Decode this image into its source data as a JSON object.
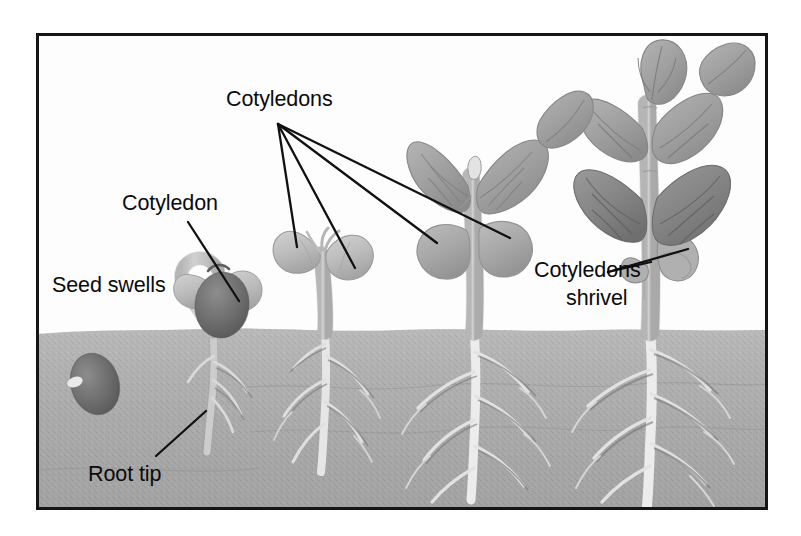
{
  "figure": {
    "frame": {
      "x": 36,
      "y": 33,
      "width": 732,
      "height": 477,
      "border_color": "#151515",
      "border_width": 3,
      "sky_color": "#fefefe"
    },
    "soil": {
      "label": "soil",
      "top_y": 330,
      "fill_light": "#b9b9b9",
      "fill_dark": "#8e8e8e",
      "texture": "speckled-grey"
    },
    "colors": {
      "ink": "#0b0b0b",
      "leader_line": "#111111",
      "cotyledon_pale": "#c3c3c3",
      "cotyledon_mid": "#a8a8a8",
      "seed_dark": "#6f6f6f",
      "stem_pale": "#d8d8d8",
      "leaf_mid": "#a4a4a4",
      "leaf_dark": "#8a8a8a",
      "root_pale": "#e8e8e8",
      "root_shadow": "#6a6a6a"
    }
  },
  "labels": [
    {
      "id": "cotyledons-top",
      "text": "Cotyledons",
      "x": 226,
      "y": 106,
      "anchor": "start",
      "leader_origin": {
        "x": 278,
        "y": 124
      },
      "leader_targets": [
        {
          "x": 297,
          "y": 247,
          "note": "stage-2 left cotyledon"
        },
        {
          "x": 355,
          "y": 268,
          "note": "stage-2 right cotyledon"
        },
        {
          "x": 437,
          "y": 243,
          "note": "stage-3 left cotyledon"
        },
        {
          "x": 510,
          "y": 238,
          "note": "stage-3 right cotyledon"
        }
      ]
    },
    {
      "id": "cotyledon-single",
      "text": "Cotyledon",
      "x": 122,
      "y": 210,
      "anchor": "start",
      "leader_origin": {
        "x": 188,
        "y": 222
      },
      "leader_targets": [
        {
          "x": 239,
          "y": 301,
          "note": "stage-1 emerging cotyledon"
        }
      ]
    },
    {
      "id": "seed-swells",
      "text": "Seed swells",
      "x": 52,
      "y": 292,
      "anchor": "start",
      "leader_origin": null,
      "leader_targets": []
    },
    {
      "id": "root-tip",
      "text": "Root tip",
      "x": 88,
      "y": 481,
      "anchor": "start",
      "leader_origin": {
        "x": 156,
        "y": 456
      },
      "leader_targets": [
        {
          "x": 206,
          "y": 411,
          "note": "stage-1 radicle tip"
        }
      ]
    },
    {
      "id": "cotyledons-shrivel-line1",
      "text": "Cotyledons",
      "x": 534,
      "y": 277,
      "anchor": "start",
      "leader_origin": {
        "x": 608,
        "y": 272
      },
      "leader_targets": [
        {
          "x": 688,
          "y": 249,
          "note": "stage-4 right shrivelled cotyledon"
        },
        {
          "x": 651,
          "y": 262,
          "note": "stage-4 left shrivelled cotyledon"
        }
      ]
    },
    {
      "id": "cotyledons-shrivel-line2",
      "text": "shrivel",
      "x": 566,
      "y": 305,
      "anchor": "start",
      "leader_origin": null,
      "leader_targets": []
    }
  ],
  "stages": [
    {
      "id": "stage-0",
      "name": "dormant-seed",
      "caption": "Seed swells",
      "x": 92,
      "soil_depth": 385,
      "parts": [
        "seed coat",
        "hilum"
      ]
    },
    {
      "id": "stage-1",
      "name": "germinating-seed",
      "caption": "Cotyledon / Root tip",
      "x": 215,
      "soil_depth": 455,
      "parts": [
        "seed coat",
        "hooked hypocotyl",
        "cotyledon",
        "radicle",
        "root tip"
      ]
    },
    {
      "id": "stage-2",
      "name": "young-seedling",
      "caption": "Cotyledons",
      "x": 325,
      "soil_depth": 470,
      "parts": [
        "two open cotyledons",
        "hypocotyl",
        "taproot",
        "lateral roots"
      ]
    },
    {
      "id": "stage-3",
      "name": "seedling-with-true-leaves",
      "caption": "Cotyledons",
      "x": 475,
      "soil_depth": 500,
      "parts": [
        "true leaves",
        "two cotyledons",
        "stem",
        "branching root system"
      ]
    },
    {
      "id": "stage-4",
      "name": "young-plant",
      "caption": "Cotyledons shrivel",
      "x": 650,
      "soil_depth": 505,
      "parts": [
        "multiple leaf pairs",
        "shrivelled cotyledons",
        "stem",
        "deep root system"
      ]
    }
  ]
}
